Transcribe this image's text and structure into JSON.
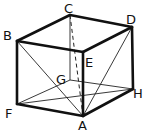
{
  "diagram": {
    "type": "cube",
    "vertices": {
      "A": {
        "x": 83,
        "y": 116,
        "label_x": 78,
        "label_y": 130
      },
      "B": {
        "x": 17,
        "y": 41,
        "label_x": 3,
        "label_y": 40
      },
      "C": {
        "x": 70,
        "y": 15,
        "label_x": 64,
        "label_y": 13
      },
      "D": {
        "x": 132,
        "y": 27,
        "label_x": 126,
        "label_y": 24
      },
      "E": {
        "x": 83,
        "y": 52,
        "label_x": 85,
        "label_y": 67
      },
      "F": {
        "x": 17,
        "y": 104,
        "label_x": 5,
        "label_y": 118
      },
      "G": {
        "x": 70,
        "y": 80,
        "label_x": 56,
        "label_y": 84
      },
      "H": {
        "x": 133,
        "y": 89,
        "label_x": 133,
        "label_y": 98
      }
    },
    "labels": [
      "A",
      "B",
      "C",
      "D",
      "E",
      "F",
      "G",
      "H"
    ],
    "thick_edges": [
      [
        "B",
        "C"
      ],
      [
        "C",
        "D"
      ],
      [
        "B",
        "E"
      ],
      [
        "E",
        "D"
      ],
      [
        "E",
        "A"
      ],
      [
        "B",
        "F"
      ],
      [
        "F",
        "A"
      ],
      [
        "A",
        "H"
      ],
      [
        "H",
        "D"
      ]
    ],
    "thin_edges": [
      [
        "C",
        "G"
      ],
      [
        "G",
        "F"
      ],
      [
        "G",
        "H"
      ],
      [
        "B",
        "A"
      ],
      [
        "D",
        "A"
      ],
      [
        "F",
        "H"
      ]
    ],
    "dashed_edges": [
      [
        "C",
        "A"
      ]
    ]
  }
}
